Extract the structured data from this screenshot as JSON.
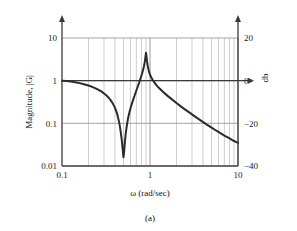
{
  "figure": {
    "caption": "(a)"
  },
  "chart_data": {
    "type": "line",
    "title": "",
    "xlabel": "ω (rad/sec)",
    "ylabel": "Magnitude, |G|",
    "y2label": "db",
    "xscale": "log",
    "yscale": "log",
    "xlim": [
      0.1,
      10
    ],
    "ylim": [
      0.01,
      20
    ],
    "grid": true,
    "grid_minor": true,
    "legend": null,
    "xticks": [
      "0.1",
      "1",
      "10"
    ],
    "xtick_values": [
      0.1,
      1,
      10
    ],
    "yticks": [
      "0.01",
      "0.1",
      "1",
      "10"
    ],
    "ytick_values": [
      0.01,
      0.1,
      1,
      10
    ],
    "y2ticks": [
      "−40",
      "−20",
      "0",
      "20"
    ],
    "y2tick_values": [
      -40,
      -20,
      0,
      20
    ],
    "annotations": {
      "notch_frequency": 0.5,
      "notch_magnitude": 0.016,
      "resonance_frequency": 0.9,
      "resonance_magnitude": 4.5,
      "start_magnitude": 1.0,
      "end_magnitude": 0.035
    },
    "series": [
      {
        "name": "|G|",
        "color": "#2b2b2b",
        "x": [
          0.1,
          0.112,
          0.126,
          0.141,
          0.158,
          0.178,
          0.2,
          0.224,
          0.251,
          0.282,
          0.316,
          0.335,
          0.355,
          0.376,
          0.398,
          0.422,
          0.447,
          0.457,
          0.468,
          0.479,
          0.49,
          0.495,
          0.5,
          0.505,
          0.511,
          0.521,
          0.531,
          0.542,
          0.562,
          0.584,
          0.608,
          0.631,
          0.661,
          0.692,
          0.724,
          0.75,
          0.776,
          0.8,
          0.825,
          0.85,
          0.87,
          0.885,
          0.895,
          0.9,
          0.906,
          0.912,
          0.925,
          0.94,
          0.96,
          0.98,
          1.0,
          1.05,
          1.1,
          1.175,
          1.259,
          1.413,
          1.585,
          1.778,
          2.0,
          2.239,
          2.512,
          2.818,
          3.162,
          3.548,
          3.981,
          4.467,
          5.012,
          5.623,
          6.31,
          7.079,
          7.943,
          8.913,
          10.0
        ],
        "y": [
          1.0,
          0.978,
          0.95,
          0.916,
          0.875,
          0.826,
          0.77,
          0.706,
          0.634,
          0.553,
          0.462,
          0.41,
          0.355,
          0.297,
          0.236,
          0.172,
          0.104,
          0.079,
          0.057,
          0.039,
          0.024,
          0.019,
          0.016,
          0.019,
          0.025,
          0.041,
          0.06,
          0.082,
          0.128,
          0.183,
          0.248,
          0.315,
          0.42,
          0.55,
          0.72,
          0.88,
          1.09,
          1.32,
          1.65,
          2.1,
          2.65,
          3.4,
          4.1,
          4.5,
          4.2,
          3.7,
          2.9,
          2.3,
          1.85,
          1.56,
          1.38,
          1.12,
          0.96,
          0.8,
          0.68,
          0.54,
          0.44,
          0.365,
          0.3,
          0.25,
          0.21,
          0.178,
          0.15,
          0.127,
          0.108,
          0.092,
          0.079,
          0.068,
          0.059,
          0.051,
          0.045,
          0.039,
          0.035
        ]
      }
    ]
  }
}
